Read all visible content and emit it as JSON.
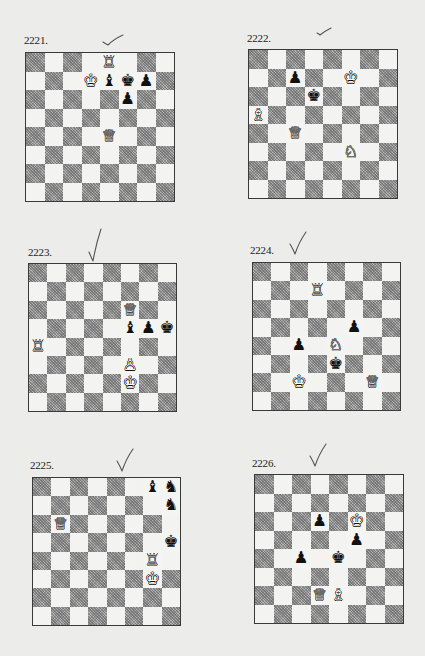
{
  "page": {
    "background": "#ececea",
    "light_square_color": "#f3f3f1",
    "dark_square_color": "#b4b4b4"
  },
  "puzzles": [
    {
      "number": "2221.",
      "check_mark": "checkmark-flat",
      "layout": {
        "board_x": 25,
        "board_y": 52,
        "board_size": 150,
        "label_x": 24,
        "label_y": 34,
        "check_x": 102,
        "check_y": 32,
        "check_style": "flat"
      },
      "pieces": [
        {
          "square": "e8",
          "color": "white",
          "type": "rook"
        },
        {
          "square": "d7",
          "color": "white",
          "type": "king"
        },
        {
          "square": "e7",
          "color": "black",
          "type": "bishop"
        },
        {
          "square": "f7",
          "color": "black",
          "type": "king"
        },
        {
          "square": "g7",
          "color": "black",
          "type": "pawn"
        },
        {
          "square": "f6",
          "color": "black",
          "type": "pawn"
        },
        {
          "square": "e4",
          "color": "white",
          "type": "queen"
        }
      ]
    },
    {
      "number": "2222.",
      "check_mark": "checkmark-small",
      "layout": {
        "board_x": 248,
        "board_y": 49,
        "board_size": 150,
        "label_x": 247,
        "label_y": 32,
        "check_x": 316,
        "check_y": 22,
        "check_style": "small"
      },
      "pieces": [
        {
          "square": "c7",
          "color": "black",
          "type": "pawn"
        },
        {
          "square": "f7",
          "color": "white",
          "type": "king"
        },
        {
          "square": "d6",
          "color": "black",
          "type": "king"
        },
        {
          "square": "a5",
          "color": "white",
          "type": "bishop"
        },
        {
          "square": "c4",
          "color": "white",
          "type": "queen"
        },
        {
          "square": "f3",
          "color": "white",
          "type": "knight"
        }
      ]
    },
    {
      "number": "2223.",
      "check_mark": "checkmark",
      "layout": {
        "board_x": 28,
        "board_y": 263,
        "board_size": 149,
        "label_x": 28,
        "label_y": 246,
        "check_x": 88,
        "check_y": 228,
        "check_style": "tall"
      },
      "pieces": [
        {
          "square": "f6",
          "color": "white",
          "type": "queen"
        },
        {
          "square": "f5",
          "color": "black",
          "type": "bishop"
        },
        {
          "square": "g5",
          "color": "black",
          "type": "pawn"
        },
        {
          "square": "h5",
          "color": "black",
          "type": "king"
        },
        {
          "square": "a4",
          "color": "white",
          "type": "rook"
        },
        {
          "square": "f3",
          "color": "white",
          "type": "pawn"
        },
        {
          "square": "f2",
          "color": "white",
          "type": "king"
        }
      ]
    },
    {
      "number": "2224.",
      "check_mark": "checkmark",
      "layout": {
        "board_x": 252,
        "board_y": 262,
        "board_size": 149,
        "label_x": 250,
        "label_y": 244,
        "check_x": 289,
        "check_y": 231,
        "check_style": "normal"
      },
      "pieces": [
        {
          "square": "d7",
          "color": "white",
          "type": "rook"
        },
        {
          "square": "f5",
          "color": "black",
          "type": "pawn"
        },
        {
          "square": "c4",
          "color": "black",
          "type": "pawn"
        },
        {
          "square": "e4",
          "color": "white",
          "type": "knight"
        },
        {
          "square": "e3",
          "color": "black",
          "type": "king"
        },
        {
          "square": "c2",
          "color": "white",
          "type": "king"
        },
        {
          "square": "g2",
          "color": "white",
          "type": "queen"
        }
      ]
    },
    {
      "number": "2225.",
      "check_mark": "checkmark",
      "layout": {
        "board_x": 32,
        "board_y": 477,
        "board_size": 149,
        "label_x": 30,
        "label_y": 459,
        "check_x": 116,
        "check_y": 448,
        "check_style": "normal"
      },
      "pieces": [
        {
          "square": "g8",
          "color": "black",
          "type": "bishop"
        },
        {
          "square": "h8",
          "color": "black",
          "type": "knight"
        },
        {
          "square": "h7",
          "color": "black",
          "type": "knight"
        },
        {
          "square": "b6",
          "color": "white",
          "type": "queen"
        },
        {
          "square": "h5",
          "color": "black",
          "type": "king"
        },
        {
          "square": "g4",
          "color": "white",
          "type": "rook"
        },
        {
          "square": "g3",
          "color": "white",
          "type": "king"
        }
      ]
    },
    {
      "number": "2226.",
      "check_mark": "checkmark",
      "layout": {
        "board_x": 254,
        "board_y": 474,
        "board_size": 150,
        "label_x": 252,
        "label_y": 457,
        "check_x": 309,
        "check_y": 443,
        "check_style": "normal"
      },
      "pieces": [
        {
          "square": "d6",
          "color": "black",
          "type": "pawn"
        },
        {
          "square": "f6",
          "color": "white",
          "type": "king"
        },
        {
          "square": "f5",
          "color": "black",
          "type": "pawn"
        },
        {
          "square": "c4",
          "color": "black",
          "type": "pawn"
        },
        {
          "square": "e4",
          "color": "black",
          "type": "king"
        },
        {
          "square": "d2",
          "color": "white",
          "type": "queen"
        },
        {
          "square": "e2",
          "color": "white",
          "type": "bishop"
        }
      ]
    }
  ],
  "piece_glyphs": {
    "white": {
      "king": "♔",
      "queen": "♕",
      "rook": "♖",
      "bishop": "♗",
      "knight": "♘",
      "pawn": "♙"
    },
    "black": {
      "king": "♚",
      "queen": "♛",
      "rook": "♜",
      "bishop": "♝",
      "knight": "♞",
      "pawn": "♟"
    }
  }
}
